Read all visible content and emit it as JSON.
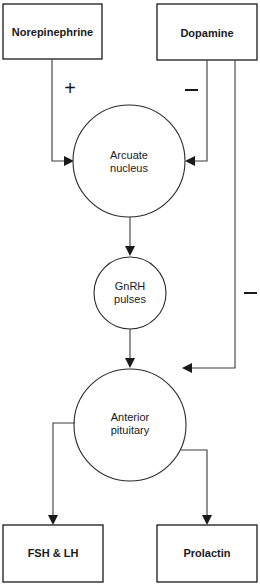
{
  "diagram": {
    "boxes": {
      "norepinephrine": "Norepinephrine",
      "dopamine": "Dopamine",
      "fsh_lh": "FSH & LH",
      "prolactin": "Prolactin"
    },
    "nodes": {
      "arcuate": {
        "line1": "Arcuate",
        "line2": "nucleus"
      },
      "gnrh": {
        "line1": "GnRH",
        "line2": "pulses"
      },
      "anterior": {
        "line1": "Anterior",
        "line2": "pituitary"
      }
    },
    "signs": {
      "norepinephrine_to_arcuate": "+",
      "dopamine_to_arcuate": "−",
      "dopamine_to_pituitary": "−"
    },
    "edges": [
      {
        "from": "Norepinephrine",
        "to": "Arcuate nucleus",
        "effect": "+"
      },
      {
        "from": "Dopamine",
        "to": "Arcuate nucleus",
        "effect": "−"
      },
      {
        "from": "Dopamine",
        "to": "Anterior pituitary",
        "effect": "−"
      },
      {
        "from": "Arcuate nucleus",
        "to": "GnRH pulses",
        "effect": ""
      },
      {
        "from": "GnRH pulses",
        "to": "Anterior pituitary",
        "effect": ""
      },
      {
        "from": "Anterior pituitary",
        "to": "FSH & LH",
        "effect": ""
      },
      {
        "from": "Anterior pituitary",
        "to": "Prolactin",
        "effect": ""
      }
    ]
  }
}
